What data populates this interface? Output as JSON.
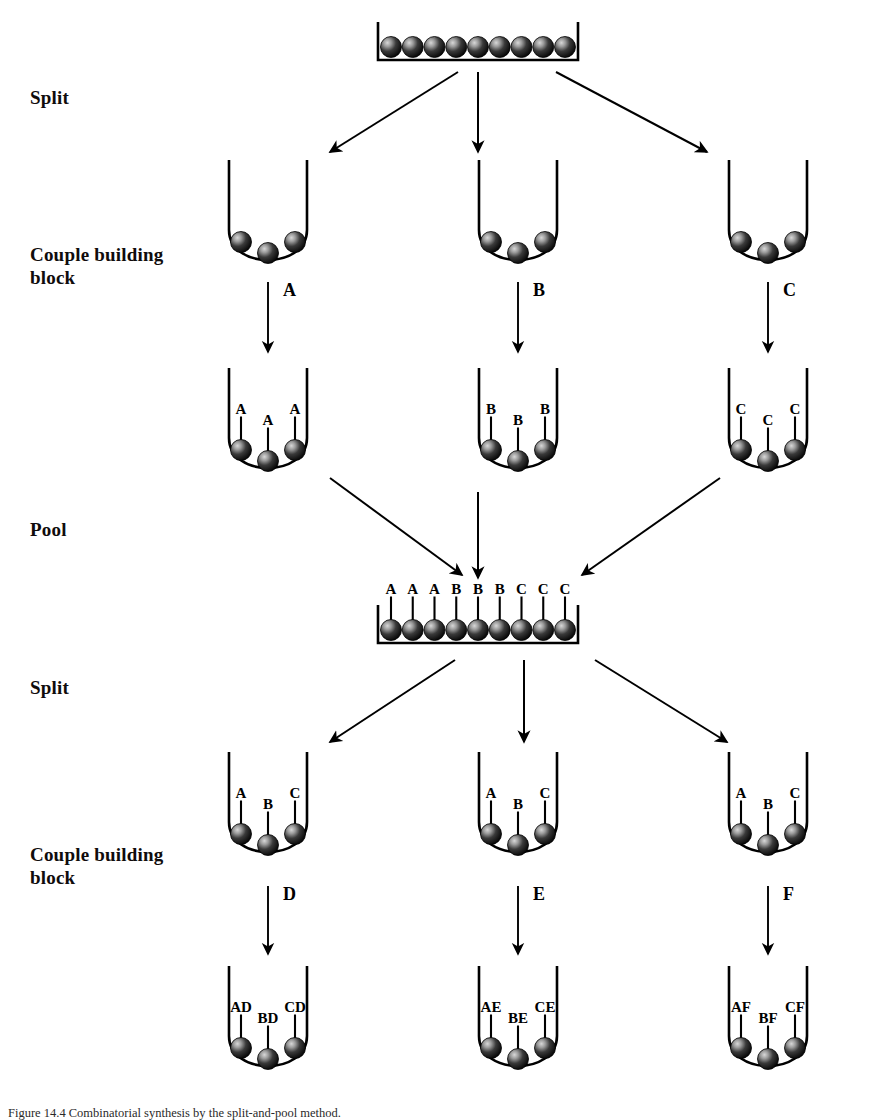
{
  "figure": {
    "background_color": "#ffffff",
    "ink_color": "#000000"
  },
  "step_labels": [
    {
      "id": "split-1",
      "text": "Split",
      "x": 30,
      "y": 86
    },
    {
      "id": "couple-1",
      "text": "Couple building\nblock",
      "x": 30,
      "y": 243
    },
    {
      "id": "pool",
      "text": "Pool",
      "x": 30,
      "y": 518
    },
    {
      "id": "split-2",
      "text": "Split",
      "x": 30,
      "y": 676
    },
    {
      "id": "couple-2",
      "text": "Couple building\nblock",
      "x": 30,
      "y": 843
    }
  ],
  "trays": [
    {
      "id": "tray-start",
      "label": "starting-bead-tray",
      "x": 378,
      "y": 22,
      "width": 200,
      "height": 38,
      "bead_count": 9,
      "bead_labels": [
        "",
        "",
        "",
        "",
        "",
        "",
        "",
        "",
        ""
      ]
    },
    {
      "id": "tray-pool",
      "label": "pooled-bead-tray",
      "x": 378,
      "y": 605,
      "width": 200,
      "height": 38,
      "bead_count": 9,
      "bead_labels": [
        "A",
        "A",
        "A",
        "B",
        "B",
        "B",
        "C",
        "C",
        "C"
      ]
    }
  ],
  "flask_rows": [
    {
      "id": "row-split1-vessels",
      "description": "three vessels after first split, unlabeled beads",
      "y": 160,
      "flasks": [
        {
          "id": "flask-s1-left",
          "cx": 268,
          "bead_labels": [
            "",
            "",
            ""
          ]
        },
        {
          "id": "flask-s1-middle",
          "cx": 518,
          "bead_labels": [
            "",
            "",
            ""
          ]
        },
        {
          "id": "flask-s1-right",
          "cx": 768,
          "bead_labels": [
            "",
            "",
            ""
          ]
        }
      ]
    },
    {
      "id": "row-couple1-vessels",
      "description": "three vessels after first coupling",
      "y": 368,
      "flasks": [
        {
          "id": "flask-c1-left",
          "cx": 268,
          "bead_labels": [
            "A",
            "A",
            "A"
          ]
        },
        {
          "id": "flask-c1-middle",
          "cx": 518,
          "bead_labels": [
            "B",
            "B",
            "B"
          ]
        },
        {
          "id": "flask-c1-right",
          "cx": 768,
          "bead_labels": [
            "C",
            "C",
            "C"
          ]
        }
      ]
    },
    {
      "id": "row-split2-vessels",
      "description": "three vessels after second split, mixed beads",
      "y": 752,
      "flasks": [
        {
          "id": "flask-s2-left",
          "cx": 268,
          "bead_labels": [
            "A",
            "B",
            "C"
          ]
        },
        {
          "id": "flask-s2-middle",
          "cx": 518,
          "bead_labels": [
            "A",
            "B",
            "C"
          ]
        },
        {
          "id": "flask-s2-right",
          "cx": 768,
          "bead_labels": [
            "A",
            "B",
            "C"
          ]
        }
      ]
    },
    {
      "id": "row-couple2-vessels",
      "description": "three vessels after second coupling, dipeptide products",
      "y": 966,
      "flasks": [
        {
          "id": "flask-c2-left",
          "cx": 268,
          "bead_labels": [
            "AD",
            "BD",
            "CD"
          ]
        },
        {
          "id": "flask-c2-middle",
          "cx": 518,
          "bead_labels": [
            "AE",
            "BE",
            "CE"
          ]
        },
        {
          "id": "flask-c2-right",
          "cx": 768,
          "bead_labels": [
            "AF",
            "BF",
            "CF"
          ]
        }
      ]
    }
  ],
  "coupling_arrows": [
    {
      "id": "arrow-couple-A",
      "reagent": "A",
      "x": 268,
      "y_top": 282,
      "y_bottom": 352,
      "label_x": 283,
      "label_y": 296
    },
    {
      "id": "arrow-couple-B",
      "reagent": "B",
      "x": 518,
      "y_top": 282,
      "y_bottom": 352,
      "label_x": 533,
      "label_y": 296
    },
    {
      "id": "arrow-couple-C",
      "reagent": "C",
      "x": 768,
      "y_top": 282,
      "y_bottom": 352,
      "label_x": 783,
      "label_y": 296
    },
    {
      "id": "arrow-couple-D",
      "reagent": "D",
      "x": 268,
      "y_top": 886,
      "y_bottom": 954,
      "label_x": 283,
      "label_y": 900
    },
    {
      "id": "arrow-couple-E",
      "reagent": "E",
      "x": 518,
      "y_top": 886,
      "y_bottom": 954,
      "label_x": 533,
      "label_y": 900
    },
    {
      "id": "arrow-couple-F",
      "reagent": "F",
      "x": 768,
      "y_top": 886,
      "y_bottom": 954,
      "label_x": 783,
      "label_y": 900
    }
  ],
  "flow_arrow_groups": [
    {
      "id": "split-1-arrows",
      "kind": "diverge",
      "arrows": [
        {
          "id": "split1-left",
          "x1": 458,
          "y1": 72,
          "x2": 330,
          "y2": 152
        },
        {
          "id": "split1-middle",
          "x1": 478,
          "y1": 72,
          "x2": 478,
          "y2": 152
        },
        {
          "id": "split1-right",
          "x1": 556,
          "y1": 72,
          "x2": 707,
          "y2": 152
        }
      ]
    },
    {
      "id": "pool-arrows",
      "kind": "converge",
      "arrows": [
        {
          "id": "pool-left",
          "x1": 330,
          "y1": 478,
          "x2": 462,
          "y2": 575
        },
        {
          "id": "pool-middle",
          "x1": 478,
          "y1": 492,
          "x2": 478,
          "y2": 578
        },
        {
          "id": "pool-right",
          "x1": 720,
          "y1": 478,
          "x2": 582,
          "y2": 575
        }
      ]
    },
    {
      "id": "split-2-arrows",
      "kind": "diverge",
      "arrows": [
        {
          "id": "split2-left",
          "x1": 455,
          "y1": 660,
          "x2": 330,
          "y2": 742
        },
        {
          "id": "split2-middle",
          "x1": 524,
          "y1": 660,
          "x2": 524,
          "y2": 742
        },
        {
          "id": "split2-right",
          "x1": 595,
          "y1": 660,
          "x2": 727,
          "y2": 742
        }
      ]
    }
  ],
  "bead_geometry": {
    "radius": 10.5,
    "offsets_x": [
      -27,
      0,
      27
    ],
    "offsets_y": [
      0,
      11,
      0
    ],
    "stem_length": 26,
    "label_font_size": 15
  },
  "flask_geometry": {
    "half_width": 39,
    "wall_height": 70,
    "bowl_depth": 34
  },
  "caption": {
    "text": "Figure 14.4   Combinatorial synthesis by the split-and-pool method."
  }
}
